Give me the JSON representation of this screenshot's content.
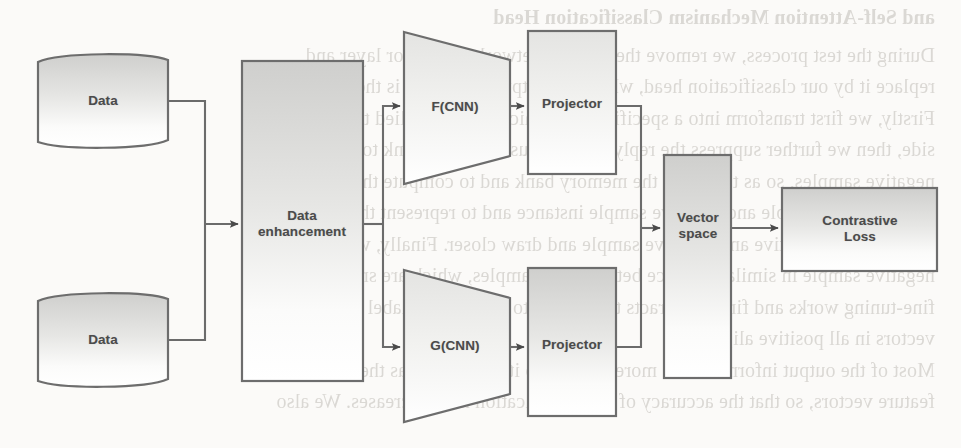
{
  "page": {
    "kind": "scanned-figure",
    "width": 961,
    "height": 448,
    "background_color": "#fbfaf8"
  },
  "bleed_through_text": {
    "note": "faint mirrored show-through text from the reverse page side",
    "heading": "and Self-Attention Mechanism Classification Head",
    "lines": [
      "During the test process, we remove the original networks Projector layer and",
      "replace it by our classification head, where the output dimension is the number",
      "Firstly, we first transform into a specific form, which is then applied to a con-",
      "side, then we further suppress the reply. Then we use memory bank to store the",
      "negative samples, so as to reduce the memory bank and to compute the loss",
      "between each sample and negative sample instance and to represent the similar",
      "between each positive and negative sample and draw closer. Finally, we take",
      "negative sample in similar distance between the samples, which are small difference",
      "fine-tuning works and finally extracts the feature to indicate the label of the vector",
      "vectors in all positive alignment.",
      "Most of the output information is more similar, so it is the same as the one of the",
      "feature vectors, so that the accuracy of the classification head increases. We also"
    ]
  },
  "figure": {
    "palette": {
      "stroke": "#6d6d6d",
      "fill_top": "#d2d2d0",
      "fill_bottom": "#fdfdfd",
      "label_color": "#4b4b4b",
      "arrow_color": "#4a4a4a"
    },
    "nodes": [
      {
        "id": "data-top",
        "label": "Data",
        "shape": "tape",
        "x": 30,
        "y": 56,
        "w": 152,
        "h": 90
      },
      {
        "id": "data-bottom",
        "label": "Data",
        "shape": "tape",
        "x": 30,
        "y": 295,
        "w": 152,
        "h": 90
      },
      {
        "id": "data-enhancement",
        "label": "Data\nenhancement",
        "shape": "rect",
        "x": 242,
        "y": 61,
        "w": 121,
        "h": 320
      },
      {
        "id": "f-cnn",
        "label": "F(CNN)",
        "shape": "trapezoid",
        "x": 404,
        "y": 30,
        "w": 106,
        "h": 155
      },
      {
        "id": "g-cnn",
        "label": "G(CNN)",
        "shape": "trapezoid",
        "x": 404,
        "y": 268,
        "w": 106,
        "h": 155
      },
      {
        "id": "projector-top",
        "label": "Projector",
        "shape": "rect",
        "x": 528,
        "y": 31,
        "w": 88,
        "h": 143
      },
      {
        "id": "projector-bottom",
        "label": "Projector",
        "shape": "rect",
        "x": 528,
        "y": 268,
        "w": 88,
        "h": 148
      },
      {
        "id": "vector-space",
        "label": "Vector\nspace",
        "shape": "rect",
        "x": 664,
        "y": 155,
        "w": 67,
        "h": 223
      },
      {
        "id": "contrastive-loss",
        "label": "Contrastive Loss",
        "shape": "rect",
        "x": 782,
        "y": 188,
        "w": 155,
        "h": 83
      }
    ],
    "edges": [
      {
        "id": "e-data-top-to-enhancement",
        "from": "data-top",
        "to": "data-enhancement",
        "arrow": true
      },
      {
        "id": "e-data-bottom-to-enhancement",
        "from": "data-bottom",
        "to": "data-enhancement",
        "arrow": true
      },
      {
        "id": "e-enhancement-to-fcnn",
        "from": "data-enhancement",
        "to": "f-cnn",
        "arrow": true
      },
      {
        "id": "e-enhancement-to-gcnn",
        "from": "data-enhancement",
        "to": "g-cnn",
        "arrow": true
      },
      {
        "id": "e-fcnn-to-projector-top",
        "from": "f-cnn",
        "to": "projector-top",
        "arrow": true
      },
      {
        "id": "e-gcnn-to-projector-bottom",
        "from": "g-cnn",
        "to": "projector-bottom",
        "arrow": true
      },
      {
        "id": "e-projector-top-to-vector",
        "from": "projector-top",
        "to": "vector-space",
        "arrow": true
      },
      {
        "id": "e-projector-bottom-to-vector",
        "from": "projector-bottom",
        "to": "vector-space",
        "arrow": true
      },
      {
        "id": "e-vector-to-loss",
        "from": "vector-space",
        "to": "contrastive-loss",
        "arrow": true
      }
    ]
  }
}
